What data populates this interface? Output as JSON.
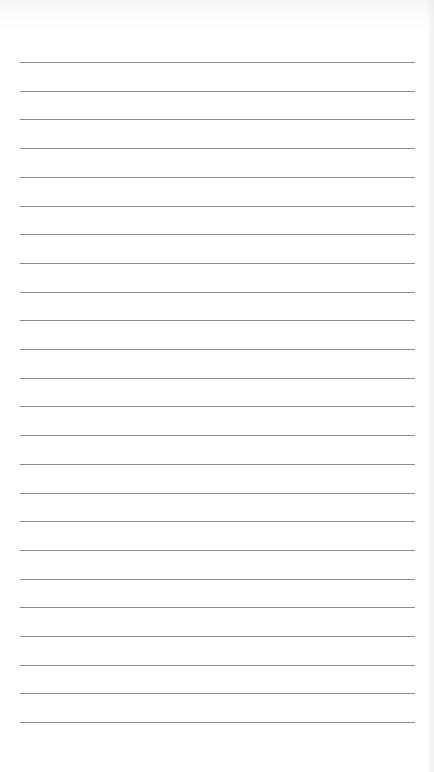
{
  "page": {
    "type": "lined-paper",
    "background_color": "#ffffff",
    "line_color": "#8a8a8a",
    "line_count": 24,
    "first_line_y": 62,
    "line_spacing": 28.7,
    "line_left": 20,
    "line_right": 415
  }
}
